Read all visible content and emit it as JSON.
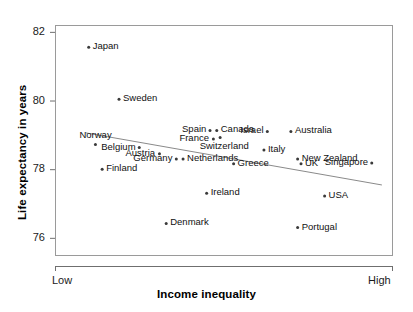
{
  "chart_data": {
    "type": "scatter",
    "title": "",
    "xlabel": "Income inequality",
    "ylabel": "Life expectancy in years",
    "xticklabels": [
      "Low",
      "High"
    ],
    "yticks": [
      76,
      78,
      80,
      82
    ],
    "ylim": [
      75.5,
      82.2
    ],
    "xlim": [
      0,
      1
    ],
    "grid": false,
    "legend": null,
    "marker_color": "#3a3a3a",
    "trendline": {
      "type": "linear",
      "x": [
        0.09,
        0.97
      ],
      "y": [
        79.06,
        77.54
      ],
      "color": "#8a8a8a"
    },
    "points": [
      {
        "name": "Japan",
        "x": 0.1,
        "y": 81.55,
        "label_side": "right"
      },
      {
        "name": "Sweden",
        "x": 0.19,
        "y": 80.04,
        "label_side": "right"
      },
      {
        "name": "Norway",
        "x": 0.12,
        "y": 78.72,
        "label_side": "above"
      },
      {
        "name": "Belgium",
        "x": 0.25,
        "y": 78.63,
        "label_side": "left"
      },
      {
        "name": "Austria",
        "x": 0.31,
        "y": 78.45,
        "label_side": "left"
      },
      {
        "name": "Germany",
        "x": 0.36,
        "y": 78.3,
        "label_side": "left"
      },
      {
        "name": "Netherlands",
        "x": 0.38,
        "y": 78.3,
        "label_side": "right"
      },
      {
        "name": "Finland",
        "x": 0.14,
        "y": 78.0,
        "label_side": "right"
      },
      {
        "name": "Denmark",
        "x": 0.33,
        "y": 76.42,
        "label_side": "right"
      },
      {
        "name": "Spain",
        "x": 0.46,
        "y": 79.13,
        "label_side": "left"
      },
      {
        "name": "Canada",
        "x": 0.48,
        "y": 79.13,
        "label_side": "right"
      },
      {
        "name": "France",
        "x": 0.47,
        "y": 78.88,
        "label_side": "left"
      },
      {
        "name": "Switzerland",
        "x": 0.49,
        "y": 78.92,
        "label_side": "below"
      },
      {
        "name": "Israel",
        "x": 0.63,
        "y": 79.1,
        "label_side": "left"
      },
      {
        "name": "Australia",
        "x": 0.7,
        "y": 79.1,
        "label_side": "right"
      },
      {
        "name": "Italy",
        "x": 0.62,
        "y": 78.56,
        "label_side": "right"
      },
      {
        "name": "New Zealand",
        "x": 0.72,
        "y": 78.3,
        "label_side": "right"
      },
      {
        "name": "UK",
        "x": 0.73,
        "y": 78.16,
        "label_side": "right"
      },
      {
        "name": "Greece",
        "x": 0.53,
        "y": 78.16,
        "label_side": "right"
      },
      {
        "name": "Ireland",
        "x": 0.45,
        "y": 77.3,
        "label_side": "right"
      },
      {
        "name": "Singapore",
        "x": 0.94,
        "y": 78.18,
        "label_side": "left"
      },
      {
        "name": "USA",
        "x": 0.8,
        "y": 77.22,
        "label_side": "right"
      },
      {
        "name": "Portugal",
        "x": 0.72,
        "y": 76.3,
        "label_side": "right"
      }
    ]
  }
}
